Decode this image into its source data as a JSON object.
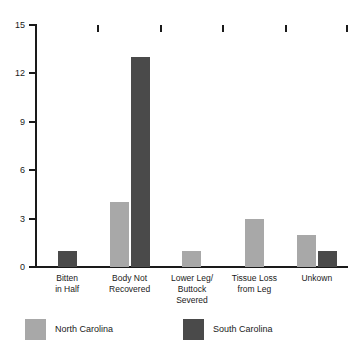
{
  "chart_data": {
    "type": "bar",
    "title": "",
    "subtitle": "",
    "xlabel": "",
    "ylabel": "",
    "ylim": [
      0,
      15
    ],
    "yticks": [
      0,
      3,
      6,
      9,
      12,
      15
    ],
    "grid": false,
    "legend_position": "bottom-left",
    "categories": [
      "Bitten\nin Half",
      "Body Not\nRecovered",
      "Lower Leg/\nButtock\nSevered",
      "Tissue Loss\nfrom Leg",
      "Unkown"
    ],
    "series": [
      {
        "name": "North Carolina",
        "color": "#a8a8a8",
        "values": [
          0,
          4,
          1,
          3,
          2
        ]
      },
      {
        "name": "South Carolina",
        "color": "#4a4a4a",
        "values": [
          1,
          13,
          0,
          0,
          1
        ]
      }
    ]
  },
  "axis": {
    "y": {
      "ticks": [
        {
          "value": 15,
          "label": "15"
        },
        {
          "value": 12,
          "label": "12"
        },
        {
          "value": 9,
          "label": "9"
        },
        {
          "value": 6,
          "label": "6"
        },
        {
          "value": 3,
          "label": "3"
        },
        {
          "value": 0,
          "label": "0"
        }
      ]
    },
    "x": {
      "labels": [
        {
          "line1": "Bitten",
          "line2": "in Half",
          "line3": ""
        },
        {
          "line1": "Body Not",
          "line2": "Recovered",
          "line3": ""
        },
        {
          "line1": "Lower Leg/",
          "line2": "Buttock",
          "line3": "Severed"
        },
        {
          "line1": "Tissue Loss",
          "line2": "from Leg",
          "line3": ""
        },
        {
          "line1": "Unkown",
          "line2": "",
          "line3": ""
        }
      ]
    }
  },
  "legend": {
    "items": [
      {
        "label": "North Carolina",
        "color": "#a8a8a8"
      },
      {
        "label": "South Carolina",
        "color": "#4a4a4a"
      }
    ]
  }
}
